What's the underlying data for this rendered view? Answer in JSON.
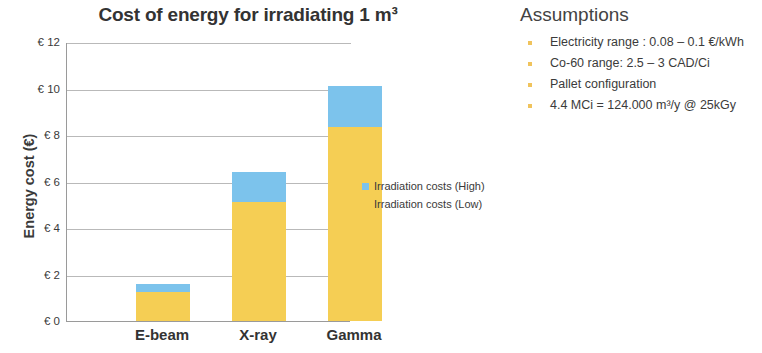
{
  "chart_data": {
    "type": "bar",
    "title": "Cost of energy for irradiating 1 m³",
    "xlabel": "",
    "ylabel": "Energy cost (€)",
    "categories": [
      "E-beam",
      "X-ray",
      "Gamma"
    ],
    "series": [
      {
        "name": "Irradiation costs (Low)",
        "values": [
          1.25,
          5.1,
          8.35
        ],
        "color": "#f5ce54"
      },
      {
        "name": "Irradiation costs (High)",
        "values": [
          1.6,
          6.4,
          10.1
        ],
        "color": "#7cc3ec"
      }
    ],
    "stacked": true,
    "stack_note": "High series is drawn as the upper segment spanning from the Low value to the High value",
    "ylim": [
      0,
      12
    ],
    "ytick_values": [
      0,
      2,
      4,
      6,
      8,
      10,
      12
    ],
    "ytick_labels": [
      "€ 0",
      "€ 2",
      "€ 4",
      "€ 6",
      "€ 8",
      "€ 10",
      "€ 12"
    ],
    "grid": true,
    "legend_position": "right"
  },
  "legend": {
    "entries": [
      {
        "label": "Irradiation costs (High)",
        "color": "#7cc3ec"
      },
      {
        "label": "Irradiation costs (Low)",
        "color": "#f5ce54"
      }
    ]
  },
  "assumptions": {
    "title": "Assumptions",
    "items": [
      "Electricity range : 0.08 – 0.1 €/kWh",
      "Co-60 range: 2.5 – 3 CAD/Ci",
      "Pallet configuration",
      "4.4 MCi = 124.000 m³/y @ 25kGy"
    ]
  },
  "colors": {
    "low": "#f5ce54",
    "high": "#7cc3ec",
    "bullet": "#f0c35c",
    "axis": "#9a9a9a",
    "grid": "#b9b9b9",
    "text": "#3b3b3b"
  }
}
